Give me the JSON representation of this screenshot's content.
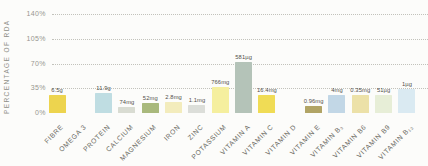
{
  "chart_data": {
    "type": "bar",
    "title": "",
    "xlabel": "",
    "ylabel": "PERCENTAGE OF RDA",
    "ylim": [
      0,
      150
    ],
    "grid": "dotted-horizontal",
    "legend": "none",
    "yticks": [
      {
        "label": "140%",
        "value": 140
      },
      {
        "label": "105%",
        "value": 105
      },
      {
        "label": "70%",
        "value": 70
      },
      {
        "label": "35%",
        "value": 35
      },
      {
        "label": "0%",
        "value": 0
      }
    ],
    "categories": [
      "FIBRE",
      "OMEGA 3",
      "PROTEIN",
      "CALCIUM",
      "MAGNESIUM",
      "IRON",
      "ZINC",
      "POTASSIUM",
      "VITAMIN A",
      "VITAMIN C",
      "VITAMIN D",
      "VITAMIN E",
      "VITAMIN B₃",
      "VITAMIN B6",
      "VITAMIN B9",
      "VITAMIN B₁₂"
    ],
    "values": [
      25,
      0,
      28,
      9,
      14,
      16,
      11,
      37,
      72,
      26,
      0,
      10,
      25,
      25,
      25,
      34
    ],
    "value_labels": [
      "6.5g",
      "",
      "11.9g",
      "74mg",
      "52mg",
      "2.8mg",
      "1.1mg",
      "766mg",
      "581µg",
      "16.4mg",
      "",
      "0.96mg",
      "4mg",
      "0.35mg",
      "51µg",
      "1µg"
    ],
    "bar_colors": [
      "#edd44e",
      "#ffffff",
      "#bfdde2",
      "#d9dcd2",
      "#a9b97c",
      "#f3ecbc",
      "#dcded9",
      "#f5ef9e",
      "#b4c3b8",
      "#f0dc55",
      "#ffffff",
      "#b1a465",
      "#c2d7e6",
      "#ece1a8",
      "#e7eed7",
      "#daeaf2"
    ],
    "colors": {
      "background": "#fcfcfa",
      "gridline": "#b9b9b1",
      "tick_text": "#97968f",
      "axis_title_text": "#8f8f88",
      "value_text": "#52504a",
      "category_text": "#6b6a62"
    }
  }
}
